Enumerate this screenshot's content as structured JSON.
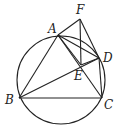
{
  "diagram": {
    "circle": {
      "cx": 61,
      "cy": 80,
      "r": 44
    },
    "points": {
      "A": {
        "x": 58,
        "y": 35,
        "label": "A",
        "lx": 48,
        "ly": 33
      },
      "F": {
        "x": 80,
        "y": 19,
        "label": "F",
        "lx": 76,
        "ly": 14
      },
      "D": {
        "x": 99,
        "y": 58,
        "label": "D",
        "lx": 103,
        "ly": 62
      },
      "E": {
        "x": 81,
        "y": 65,
        "label": "E",
        "lx": 74,
        "ly": 80
      },
      "B": {
        "x": 19,
        "y": 98,
        "label": "B",
        "lx": 5,
        "ly": 104
      },
      "C": {
        "x": 102,
        "y": 98,
        "label": "C",
        "lx": 104,
        "ly": 109
      }
    },
    "segments": [
      [
        "A",
        "F"
      ],
      [
        "F",
        "E"
      ],
      [
        "F",
        "D"
      ],
      [
        "A",
        "B"
      ],
      [
        "A",
        "C"
      ],
      [
        "A",
        "D"
      ],
      [
        "A",
        "E"
      ],
      [
        "B",
        "D"
      ],
      [
        "B",
        "C"
      ],
      [
        "D",
        "C"
      ],
      [
        "E",
        "D"
      ]
    ]
  }
}
